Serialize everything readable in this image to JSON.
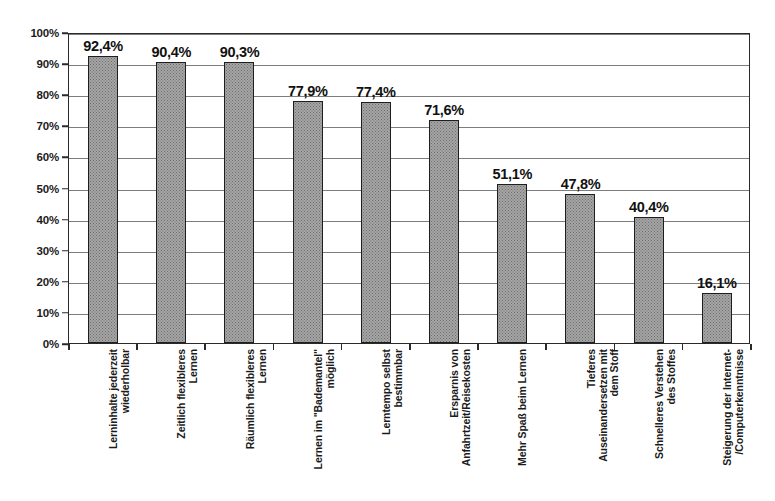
{
  "chart_data": {
    "type": "bar",
    "title": "",
    "subtitle": "",
    "xlabel": "",
    "ylabel": "",
    "ylim": [
      0,
      100
    ],
    "yunit": "%",
    "grid": true,
    "legend": "none",
    "orientation": "vertical",
    "decimal_separator": ",",
    "categories": [
      "Lerninhalte jederzeit wiederholbar",
      "Zeitlich flexibleres Lernen",
      "Räumlich flexibleres Lernen",
      "Lernen im \"Bademantel\" möglich",
      "Lerntempo selbst bestimmbar",
      "Ersparnis von Anfahrtzeit/Reisekosten",
      "Mehr Spaß beim Lernen",
      "Tieferes Auseinandersetzen mit dem Stoff",
      "Schnelleres Verstehen des Stoffes",
      "Steigerung der Internet- /Computerkenntnisse"
    ],
    "category_lines": [
      [
        "Lerninhalte jederzeit",
        "wiederholbar"
      ],
      [
        "Zeitlich flexibleres",
        "Lernen"
      ],
      [
        "Räumlich flexibleres",
        "Lernen"
      ],
      [
        "Lernen im \"Bademantel\"",
        "möglich"
      ],
      [
        "Lerntempo selbst",
        "bestimmbar"
      ],
      [
        "Ersparnis von",
        "Anfahrtzeit/Reisekosten"
      ],
      [
        "Mehr Spaß beim Lernen"
      ],
      [
        "Tieferes",
        "Auseinandersetzen mit",
        "dem Stoff"
      ],
      [
        "Schnelleres Verstehen",
        "des Stoffes"
      ],
      [
        "Steigerung der Internet-",
        "/Computerkenntnisse"
      ]
    ],
    "values": [
      92.4,
      90.4,
      90.3,
      77.9,
      77.4,
      71.6,
      51.1,
      47.8,
      40.4,
      16.1
    ],
    "data_labels": [
      "92,4%",
      "90,4%",
      "90,3%",
      "77,9%",
      "77,4%",
      "71,6%",
      "51,1%",
      "47,8%",
      "40,4%",
      "16,1%"
    ],
    "y_ticks": [
      0,
      10,
      20,
      30,
      40,
      50,
      60,
      70,
      80,
      90,
      100
    ],
    "y_tick_labels": [
      "0%",
      "10%",
      "20%",
      "30%",
      "40%",
      "50%",
      "60%",
      "70%",
      "80%",
      "90%",
      "100%"
    ],
    "colors": {
      "bar_fill": "#a5a5a5",
      "bar_pattern": "#6f6f6f",
      "bar_border": "#1e1e1e",
      "gridline": "#7d7d7d",
      "frame": "#2a2a2a",
      "text": "#111111",
      "background": "#ffffff"
    }
  }
}
